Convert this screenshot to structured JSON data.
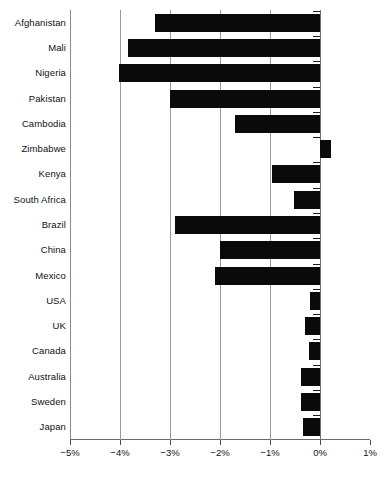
{
  "chart_data": {
    "type": "bar",
    "orientation": "horizontal",
    "title": "",
    "subtitle": "",
    "xlabel": "",
    "ylabel": "",
    "categories": [
      "Afghanistan",
      "Mali",
      "Nigeria",
      "Pakistan",
      "Cambodia",
      "Zimbabwe",
      "Kenya",
      "South Africa",
      "Brazil",
      "China",
      "Mexico",
      "USA",
      "UK",
      "Canada",
      "Australia",
      "Sweden",
      "Japan"
    ],
    "values": [
      -3.3,
      -3.84,
      -4.02,
      -3.0,
      -1.7,
      0.22,
      -0.96,
      -0.52,
      -2.9,
      -2.0,
      -2.1,
      -0.2,
      -0.3,
      -0.22,
      -0.38,
      -0.38,
      -0.34
    ],
    "value_unit": "%",
    "xlim": [
      -5,
      1
    ],
    "xticks": [
      -5,
      -4,
      -3,
      -2,
      -1,
      0,
      1
    ],
    "xtick_labels": [
      "−5%",
      "−4%",
      "−3%",
      "−2%",
      "−1%",
      "0%",
      "1%"
    ],
    "grid": true,
    "grid_axis": "x",
    "legend": null,
    "bar_color": "#0a0a0a",
    "gridline_color": "#9a9a9a",
    "axis_color": "#6a6a6a",
    "background_color": "#ffffff"
  },
  "caption_sliver": "                "
}
